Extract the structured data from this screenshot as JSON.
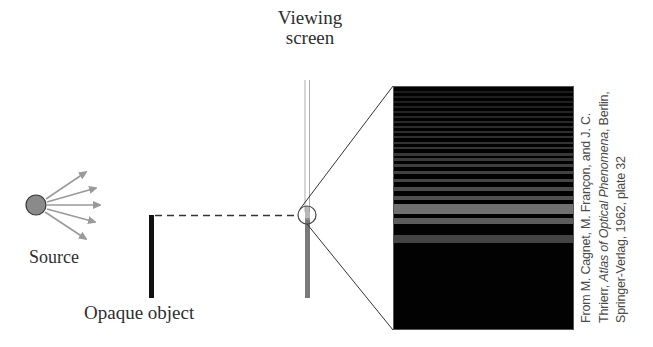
{
  "labels": {
    "viewing_screen_line1": "Viewing",
    "viewing_screen_line2": "screen",
    "source": "Source",
    "opaque_object": "Opaque object"
  },
  "caption": {
    "line1": "From M. Cagnet, M. Françon, and J. C.",
    "line2_a": "Thrierr, ",
    "line2_italic": "Atlas of Optical Phenomena",
    "line2_b": ", Berlin,",
    "line3": "Springer-Verlag, 1962, plate 32"
  },
  "colors": {
    "source_fill": "#8a8a8a",
    "arrow": "#9a9a9a",
    "opaque_object": "#111111",
    "screen_line": "#b0b0b0",
    "fringe_panel_bg": "#020202",
    "fringe_bright": "#6e6e6e",
    "zoom_line": "#333333"
  },
  "fringes": [
    {
      "top": 4,
      "h": 2,
      "c": "#1c1c1c"
    },
    {
      "top": 9,
      "h": 2,
      "c": "#1e1e1e"
    },
    {
      "top": 14,
      "h": 2,
      "c": "#202020"
    },
    {
      "top": 19,
      "h": 2,
      "c": "#222222"
    },
    {
      "top": 24,
      "h": 2,
      "c": "#252525"
    },
    {
      "top": 29,
      "h": 2,
      "c": "#272727"
    },
    {
      "top": 34,
      "h": 2,
      "c": "#292929"
    },
    {
      "top": 39,
      "h": 2,
      "c": "#2b2b2b"
    },
    {
      "top": 44,
      "h": 2,
      "c": "#2e2e2e"
    },
    {
      "top": 49,
      "h": 2,
      "c": "#303030"
    },
    {
      "top": 55,
      "h": 2,
      "c": "#333333"
    },
    {
      "top": 60,
      "h": 2,
      "c": "#353535"
    },
    {
      "top": 66,
      "h": 3,
      "c": "#383838"
    },
    {
      "top": 71,
      "h": 3,
      "c": "#3b3b3b"
    },
    {
      "top": 77,
      "h": 3,
      "c": "#3e3e3e"
    },
    {
      "top": 84,
      "h": 3,
      "c": "#424242"
    },
    {
      "top": 92,
      "h": 3,
      "c": "#464646"
    },
    {
      "top": 100,
      "h": 4,
      "c": "#4b4b4b"
    },
    {
      "top": 109,
      "h": 4,
      "c": "#4f4f4f"
    },
    {
      "top": 119,
      "h": 5,
      "c": "#555555"
    },
    {
      "top": 131,
      "h": 6,
      "c": "#5c5c5c"
    },
    {
      "top": 148,
      "h": 8,
      "c": "#444444"
    },
    {
      "top": 117,
      "h": 10,
      "c": "#707070"
    }
  ]
}
